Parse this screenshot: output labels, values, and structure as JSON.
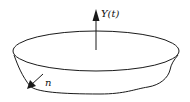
{
  "diagram": {
    "type": "surface-with-vectors",
    "labels": {
      "velocity": "Y(t)",
      "normal": "n"
    },
    "colors": {
      "stroke": "#1a1a1a",
      "background": "#ffffff"
    }
  }
}
